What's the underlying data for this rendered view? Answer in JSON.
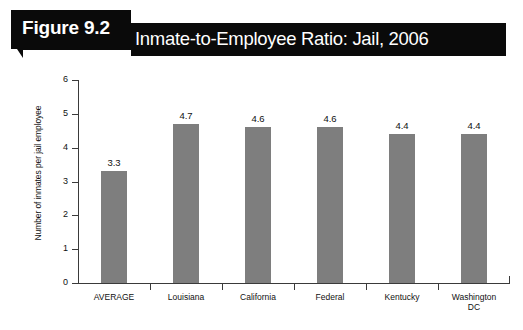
{
  "header": {
    "figure_number": "Figure 9.2",
    "title": "Inmate-to-Employee Ratio: Jail, 2006",
    "background_color": "#0a0a0a",
    "text_color": "#ffffff"
  },
  "chart_data": {
    "type": "bar",
    "title": "Inmate-to-Employee Ratio: Jail, 2006",
    "categories": [
      "AVERAGE",
      "Louisiana",
      "California",
      "Federal",
      "Kentucky",
      "Washington\nDC"
    ],
    "values": [
      3.3,
      4.7,
      4.6,
      4.6,
      4.4,
      4.4
    ],
    "data_labels": [
      "3.3",
      "4.7",
      "4.6",
      "4.6",
      "4.4",
      "4.4"
    ],
    "xlabel": "",
    "ylabel": "Number of inmates per jail employee",
    "ylim": [
      0,
      6
    ],
    "ytick_labels": [
      "0",
      "1",
      "2",
      "3",
      "4",
      "5",
      "6"
    ],
    "ytick_values": [
      0,
      1,
      2,
      3,
      4,
      5,
      6
    ],
    "grid": false,
    "legend": false,
    "bar_color": "#7e7e7e",
    "axis_color": "#3a3a3a"
  }
}
